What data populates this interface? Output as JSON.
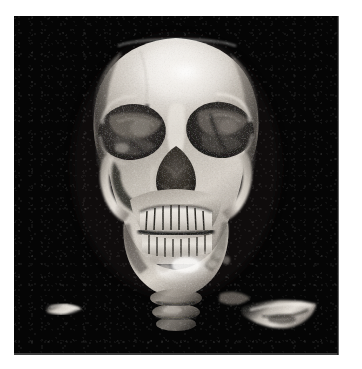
{
  "document": {
    "title": "3D CT Volume Rendering - Skull",
    "modality": "CT",
    "rendering": "3D volume rendering / surface shaded display",
    "view": "Anterior (frontal) view",
    "colormap": "grayscale"
  },
  "canvas": {
    "background_color": "#050505",
    "page_background_color": "#ffffff",
    "left": 14,
    "top": 16,
    "width": 324,
    "height": 337
  },
  "palette": {
    "background": "#050505",
    "bone_highlight": "#f2f0ee",
    "bone_bright": "#ddd9d4",
    "bone_mid": "#b5afa8",
    "bone_base": "#8e8880",
    "bone_shadow": "#5d5853",
    "bone_dark": "#3a3632",
    "cavity_dark": "#242120",
    "cavity_deep": "#15130f",
    "fragment": "#cfc9c1"
  },
  "anatomy": {
    "label": "Human skull reconstruction",
    "structures": [
      {
        "name": "calvarium",
        "label": "Calvarium (cranial vault, superiorly clipped)"
      },
      {
        "name": "frontal-bone",
        "label": "Frontal bone"
      },
      {
        "name": "left-orbit",
        "label": "Left orbit"
      },
      {
        "name": "right-orbit",
        "label": "Right orbit"
      },
      {
        "name": "nasal-aperture",
        "label": "Piriform aperture / nasal cavity"
      },
      {
        "name": "zygomatic-arch-left",
        "label": "Left zygomatic arch"
      },
      {
        "name": "zygomatic-arch-right",
        "label": "Right zygomatic arch"
      },
      {
        "name": "maxilla",
        "label": "Maxilla with upper dental arch"
      },
      {
        "name": "mandible",
        "label": "Mandible with lower dental arch"
      },
      {
        "name": "cervical-spine",
        "label": "Cervical vertebrae"
      },
      {
        "name": "bone-fragment-left",
        "label": "Peripheral bone fragment (left)"
      },
      {
        "name": "bone-fragment-right",
        "label": "Peripheral bone fragment (right)"
      }
    ]
  },
  "teeth": {
    "upper_count": 12,
    "lower_count": 12
  }
}
